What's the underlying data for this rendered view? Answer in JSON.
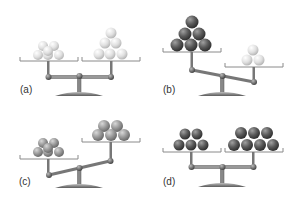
{
  "figure": {
    "panels": [
      {
        "id": "a",
        "label": "(a)",
        "state": "balanced",
        "left": {
          "balls": 6,
          "color": "light"
        },
        "right": {
          "balls": 6,
          "color": "light"
        }
      },
      {
        "id": "b",
        "label": "(b)",
        "state": "left-heavy",
        "left": {
          "balls": 6,
          "color": "dark"
        },
        "right": {
          "balls": 3,
          "color": "light"
        }
      },
      {
        "id": "c",
        "label": "(c)",
        "state": "right-heavy",
        "left": {
          "balls": 6,
          "color": "medium"
        },
        "right": {
          "balls": 7,
          "color": "medium"
        }
      },
      {
        "id": "d",
        "label": "(d)",
        "state": "balanced",
        "left": {
          "balls": 5,
          "color": "dark"
        },
        "right": {
          "balls": 7,
          "color": "dark"
        }
      }
    ],
    "colors": {
      "light": "#e2e2e2",
      "medium": "#9a9a9a",
      "dark": "#5a5a5a",
      "frame": "#8a8a8a",
      "background": "#ffffff"
    }
  }
}
